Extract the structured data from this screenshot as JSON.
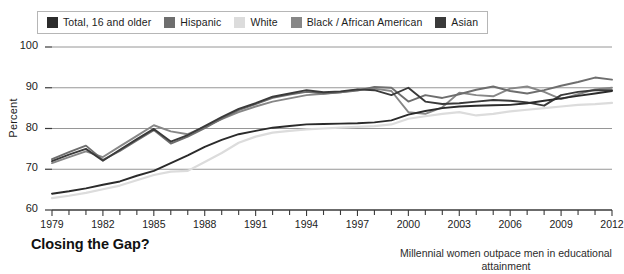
{
  "legend": {
    "items": [
      {
        "label": "Total, 16 and older",
        "color": "#2b2b2b",
        "key": "total"
      },
      {
        "label": "Hispanic",
        "color": "#6e6e6e",
        "key": "hispanic"
      },
      {
        "label": "White",
        "color": "#dcdcdc",
        "key": "white"
      },
      {
        "label": "Black / African American",
        "color": "#878787",
        "key": "black"
      },
      {
        "label": "Asian",
        "color": "#3a3a3a",
        "key": "asian"
      }
    ]
  },
  "footer": {
    "title": "Closing the Gap?",
    "caption": "Millennial women outpace men in educational attainment"
  },
  "chart_data": {
    "type": "line",
    "title": "",
    "xlabel": "",
    "ylabel": "Percent",
    "ylim": [
      60,
      100
    ],
    "xlim": [
      1979,
      2012
    ],
    "yticks": [
      60,
      70,
      80,
      90,
      100
    ],
    "xticks": [
      1979,
      1982,
      1985,
      1988,
      1991,
      1994,
      1997,
      2000,
      2003,
      2006,
      2009,
      2012
    ],
    "xtick_step_minor": 1,
    "grid": "horizontal",
    "legend_position": "top",
    "x": [
      1979,
      1980,
      1981,
      1982,
      1983,
      1984,
      1985,
      1986,
      1987,
      1988,
      1989,
      1990,
      1991,
      1992,
      1993,
      1994,
      1995,
      1996,
      1997,
      1998,
      1999,
      2000,
      2001,
      2002,
      2003,
      2004,
      2005,
      2006,
      2007,
      2008,
      2009,
      2010,
      2011,
      2012
    ],
    "series": [
      {
        "name": "Total, 16 and older",
        "color": "#2b2b2b",
        "values": [
          64.0,
          64.6,
          65.3,
          66.2,
          67.0,
          68.4,
          69.6,
          71.5,
          73.4,
          75.5,
          77.2,
          78.6,
          79.4,
          80.2,
          80.6,
          81.0,
          81.1,
          81.2,
          81.3,
          81.5,
          82.0,
          83.4,
          84.3,
          85.0,
          85.4,
          85.6,
          85.7,
          85.8,
          86.2,
          86.8,
          87.4,
          88.0,
          88.6,
          89.2
        ]
      },
      {
        "name": "Hispanic",
        "color": "#6e6e6e",
        "values": [
          72.5,
          74.2,
          75.8,
          72.3,
          74.5,
          77.1,
          79.6,
          76.3,
          78.0,
          80.1,
          82.4,
          84.5,
          86.0,
          87.5,
          88.3,
          89.0,
          88.6,
          88.9,
          89.3,
          90.2,
          90.0,
          86.6,
          88.2,
          87.5,
          88.4,
          89.5,
          90.3,
          89.2,
          88.6,
          89.4,
          90.5,
          91.4,
          92.5,
          92.0
        ]
      },
      {
        "name": "White",
        "color": "#dcdcdc",
        "values": [
          62.9,
          63.5,
          64.2,
          65.1,
          66.0,
          67.3,
          68.6,
          69.4,
          69.6,
          71.8,
          74.0,
          76.5,
          78.0,
          79.0,
          79.4,
          79.8,
          80.0,
          80.2,
          80.4,
          80.6,
          81.0,
          82.4,
          83.0,
          83.6,
          84.0,
          83.2,
          83.6,
          84.2,
          84.6,
          85.0,
          85.4,
          85.8,
          86.0,
          86.3
        ]
      },
      {
        "name": "Black / African American",
        "color": "#878787",
        "values": [
          71.5,
          73.0,
          74.4,
          73.0,
          75.6,
          78.2,
          80.8,
          79.3,
          78.6,
          80.4,
          82.3,
          84.0,
          85.4,
          86.6,
          87.4,
          88.2,
          88.5,
          88.9,
          89.5,
          89.8,
          89.2,
          84.0,
          83.6,
          85.2,
          88.8,
          88.2,
          87.9,
          89.8,
          90.3,
          89.0,
          87.2,
          88.4,
          89.6,
          90.0
        ]
      },
      {
        "name": "Asian",
        "color": "#3a3a3a",
        "values": [
          72.0,
          73.6,
          75.0,
          72.1,
          74.8,
          77.4,
          79.9,
          76.8,
          78.4,
          80.6,
          82.8,
          84.8,
          86.2,
          87.8,
          88.6,
          89.4,
          88.9,
          89.1,
          89.6,
          89.4,
          88.2,
          90.0,
          86.6,
          86.0,
          86.2,
          86.6,
          87.0,
          86.8,
          86.4,
          85.6,
          88.2,
          89.0,
          89.4,
          89.4
        ]
      }
    ]
  }
}
